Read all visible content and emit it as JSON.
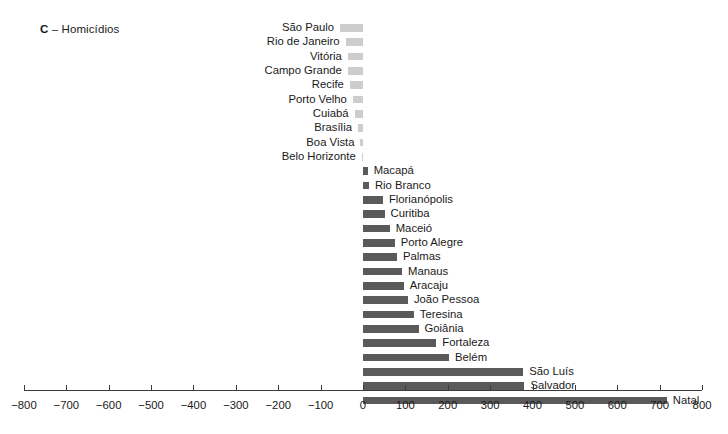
{
  "title": {
    "letter": "C",
    "dash": " – ",
    "text": "Homicídios",
    "full": "C – Homicídios"
  },
  "colors": {
    "negative_bar": "#cdcdcd",
    "positive_bar": "#5a5a5a",
    "axis": "#3b3b3b",
    "text": "#1a1a1a",
    "background": "#ffffff"
  },
  "chart_data": {
    "type": "bar",
    "orientation": "horizontal",
    "title": "C – Homicídios",
    "xlabel": "",
    "ylabel": "",
    "xlim": [
      -800,
      800
    ],
    "grid": false,
    "legend": null,
    "xticks": [
      -800,
      -700,
      -600,
      -500,
      -400,
      -300,
      -200,
      -100,
      0,
      100,
      200,
      300,
      400,
      500,
      600,
      700,
      800
    ],
    "xtick_labels": [
      "−800",
      "−700",
      "−600",
      "−500",
      "−400",
      "−300",
      "−200",
      "−100",
      "0",
      "100",
      "200",
      "300",
      "400",
      "500",
      "600",
      "700",
      "800"
    ],
    "categories": [
      "São Paulo",
      "Rio de Janeiro",
      "Vitória",
      "Campo Grande",
      "Recife",
      "Porto Velho",
      "Cuiabá",
      "Brasília",
      "Boa Vista",
      "Belo Horizonte",
      "Macapá",
      "Rio Branco",
      "Florianópolis",
      "Curitiba",
      "Maceió",
      "Porto Alegre",
      "Palmas",
      "Manaus",
      "Aracaju",
      "João Pessoa",
      "Teresina",
      "Goiânia",
      "Fortaleza",
      "Belém",
      "São Luís",
      "Salvador",
      "Natal"
    ],
    "values": [
      -54,
      -41,
      -36,
      -36,
      -31,
      -24,
      -20,
      -12,
      -6,
      -3,
      11,
      14,
      47,
      51,
      63,
      75,
      80,
      92,
      96,
      106,
      120,
      131,
      173,
      203,
      378,
      381,
      717
    ]
  },
  "rows": [
    {
      "label": "São Paulo",
      "value": -54,
      "side": "left"
    },
    {
      "label": "Rio de Janeiro",
      "value": -41,
      "side": "left"
    },
    {
      "label": "Vitória",
      "value": -36,
      "side": "left"
    },
    {
      "label": "Campo Grande",
      "value": -36,
      "side": "left"
    },
    {
      "label": "Recife",
      "value": -31,
      "side": "left"
    },
    {
      "label": "Porto Velho",
      "value": -24,
      "side": "left"
    },
    {
      "label": "Cuiabá",
      "value": -20,
      "side": "left"
    },
    {
      "label": "Brasília",
      "value": -12,
      "side": "left"
    },
    {
      "label": "Boa Vista",
      "value": -6,
      "side": "left"
    },
    {
      "label": "Belo Horizonte",
      "value": -3,
      "side": "left"
    },
    {
      "label": "Macapá",
      "value": 11,
      "side": "right"
    },
    {
      "label": "Rio Branco",
      "value": 14,
      "side": "right"
    },
    {
      "label": "Florianópolis",
      "value": 47,
      "side": "right"
    },
    {
      "label": "Curitiba",
      "value": 51,
      "side": "right"
    },
    {
      "label": "Maceió",
      "value": 63,
      "side": "right"
    },
    {
      "label": "Porto Alegre",
      "value": 75,
      "side": "right"
    },
    {
      "label": "Palmas",
      "value": 80,
      "side": "right"
    },
    {
      "label": "Manaus",
      "value": 92,
      "side": "right"
    },
    {
      "label": "Aracaju",
      "value": 96,
      "side": "right"
    },
    {
      "label": "João Pessoa",
      "value": 106,
      "side": "right"
    },
    {
      "label": "Teresina",
      "value": 120,
      "side": "right"
    },
    {
      "label": "Goiânia",
      "value": 131,
      "side": "right"
    },
    {
      "label": "Fortaleza",
      "value": 173,
      "side": "right"
    },
    {
      "label": "Belém",
      "value": 203,
      "side": "right"
    },
    {
      "label": "São Luís",
      "value": 378,
      "side": "right"
    },
    {
      "label": "Salvador",
      "value": 381,
      "side": "right"
    },
    {
      "label": "Natal",
      "value": 717,
      "side": "right"
    }
  ],
  "axis": {
    "ticks": [
      {
        "value": -800,
        "label": "−800"
      },
      {
        "value": -700,
        "label": "−700"
      },
      {
        "value": -600,
        "label": "−600"
      },
      {
        "value": -500,
        "label": "−500"
      },
      {
        "value": -400,
        "label": "−400"
      },
      {
        "value": -300,
        "label": "−300"
      },
      {
        "value": -200,
        "label": "−200"
      },
      {
        "value": -100,
        "label": "−100"
      },
      {
        "value": 0,
        "label": "0"
      },
      {
        "value": 100,
        "label": "100"
      },
      {
        "value": 200,
        "label": "200"
      },
      {
        "value": 300,
        "label": "300"
      },
      {
        "value": 400,
        "label": "400"
      },
      {
        "value": 500,
        "label": "500"
      },
      {
        "value": 600,
        "label": "600"
      },
      {
        "value": 700,
        "label": "700"
      },
      {
        "value": 800,
        "label": "800"
      }
    ]
  }
}
